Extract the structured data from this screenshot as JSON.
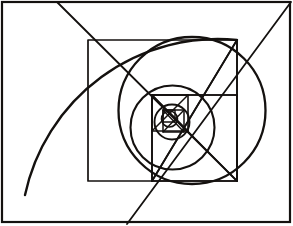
{
  "figure": {
    "kind": "geometric-line-drawing",
    "canvas": {
      "width": 293,
      "height": 226
    },
    "background_color": "#ffffff",
    "ink_color": "#14110f"
  },
  "frame": {
    "label": "outer rectangle border",
    "x": 2.0,
    "y": 2.0,
    "width": 288.0,
    "height": 220.0,
    "stroke_width": 2.2,
    "color": "#14110f"
  },
  "squares": [
    {
      "name": "square-1",
      "label": "largest inscribed square",
      "x": 88.0,
      "y": 40.0,
      "width": 149.0,
      "height": 141.0,
      "stroke_width": 1.7
    },
    {
      "name": "square-2",
      "label": "second square",
      "x": 152.0,
      "y": 95.0,
      "width": 85.0,
      "height": 86.0,
      "stroke_width": 1.7
    },
    {
      "name": "square-3",
      "label": "third square",
      "x": 152.0,
      "y": 95.0,
      "width": 36.0,
      "height": 36.0,
      "stroke_width": 1.6
    },
    {
      "name": "square-4",
      "label": "fourth square",
      "x": 163.0,
      "y": 110.0,
      "width": 21.0,
      "height": 22.0,
      "stroke_width": 1.5
    },
    {
      "name": "square-5",
      "label": "innermost square",
      "x": 163.0,
      "y": 110.0,
      "width": 12.0,
      "height": 12.0,
      "stroke_width": 1.4
    }
  ],
  "circles": [
    {
      "name": "circle-1",
      "label": "large circumscribing circle",
      "cx": 192.0,
      "cy": 110.5,
      "r": 73.5,
      "stroke_width": 2.3
    },
    {
      "name": "circle-2",
      "label": "middle circle",
      "cx": 172.5,
      "cy": 127.5,
      "r": 42.0,
      "stroke_width": 2.1
    },
    {
      "name": "circle-3",
      "label": "small circle",
      "cx": 172.0,
      "cy": 122.0,
      "r": 17.5,
      "stroke_width": 1.9
    },
    {
      "name": "circle-4",
      "label": "innermost circle",
      "cx": 169.5,
      "cy": 119.0,
      "r": 8.0,
      "stroke_width": 1.6
    }
  ],
  "arcs": [
    {
      "name": "spiral-arc-major",
      "label": "large quarter-arc sweeping from top edge to left-bottom",
      "path": "M 237 40 A 197 197 0 0 0 25 195",
      "stroke_width": 2.4
    }
  ],
  "diagonals": [
    {
      "name": "diagonal-upper-left",
      "label": "diagonal from top edge through square-1 top-left corner",
      "x1": 57.0,
      "y1": 2.0,
      "x2": 237.0,
      "y2": 181.0,
      "stroke_width": 1.8
    },
    {
      "name": "diagonal-lower-left",
      "label": "diagonal from bottom edge up through center to top-right corner",
      "x1": 127.0,
      "y1": 224.0,
      "x2": 291.0,
      "y2": 2.0,
      "stroke_width": 1.8
    },
    {
      "name": "diagonal-square1-tr-to-center",
      "label": "diagonal from square-1 top-right corner into center",
      "x1": 237.0,
      "y1": 40.0,
      "x2": 152.0,
      "y2": 181.0,
      "stroke_width": 1.7
    },
    {
      "name": "diagonal-square1-bl-to-center",
      "label": "diagonal from square-1 bottom-left corner into center",
      "x1": 152.0,
      "y1": 181.0,
      "x2": 237.0,
      "y2": 40.0,
      "stroke_width": 1.7
    },
    {
      "name": "diagonal-square2",
      "label": "diagonal across square-2 from top-left to bottom-right",
      "x1": 152.0,
      "y1": 95.0,
      "x2": 237.0,
      "y2": 181.0,
      "stroke_width": 1.6
    },
    {
      "name": "diagonal-square3",
      "label": "diagonal across square-3",
      "x1": 152.0,
      "y1": 95.0,
      "x2": 188.0,
      "y2": 131.0,
      "stroke_width": 1.5
    },
    {
      "name": "diagonal-square3-alt",
      "label": "counter diagonal across square-3",
      "x1": 188.0,
      "y1": 95.0,
      "x2": 152.0,
      "y2": 131.0,
      "stroke_width": 1.5
    },
    {
      "name": "diagonal-square4",
      "label": "diagonal across square-4",
      "x1": 163.0,
      "y1": 110.0,
      "x2": 184.0,
      "y2": 132.0,
      "stroke_width": 1.4
    },
    {
      "name": "diagonal-square4-alt",
      "label": "counter diagonal across square-4",
      "x1": 184.0,
      "y1": 110.0,
      "x2": 163.0,
      "y2": 132.0,
      "stroke_width": 1.4
    }
  ],
  "connectors": [
    {
      "name": "vertical-median-square1",
      "label": "vertical line down the right portion of square-1",
      "x1": 237.0,
      "y1": 40.0,
      "x2": 237.0,
      "y2": 181.0,
      "stroke_width": 1.6
    },
    {
      "name": "vertical-median-square2",
      "label": "vertical line at left of square-2",
      "x1": 152.0,
      "y1": 95.0,
      "x2": 152.0,
      "y2": 181.0,
      "stroke_width": 1.6
    },
    {
      "name": "horizontal-median-square2",
      "label": "horizontal top edge of square-2",
      "x1": 152.0,
      "y1": 95.0,
      "x2": 237.0,
      "y2": 95.0,
      "stroke_width": 1.6
    }
  ]
}
